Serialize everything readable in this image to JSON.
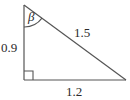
{
  "figure": {
    "type": "right-triangle-diagram",
    "stroke_color": "#555555",
    "text_color": "#2b2b2b",
    "background_color": "#ffffff",
    "vertices": {
      "top": [
        24,
        5
      ],
      "bottom_left": [
        24,
        80
      ],
      "bottom_right": [
        126,
        80
      ]
    },
    "labels": {
      "angle_beta": "β",
      "leg_vertical": "0.9",
      "hypotenuse": "1.5",
      "leg_base": "1.2"
    },
    "markers": {
      "right_angle_square": "right-angle-marker",
      "angle_arc": "beta-angle-arc"
    }
  }
}
